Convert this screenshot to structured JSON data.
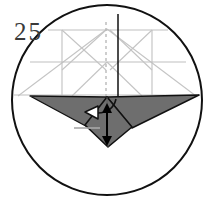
{
  "figure": {
    "kind": "origami-folding-step-diagram",
    "step_number": "25",
    "caption_position": "top-left",
    "colors": {
      "outline": "#111111",
      "paper_shaded": "#6e6e6e",
      "paper_shaded_dark": "#5f5f5f",
      "crease_line": "#b9b9b9",
      "crease_line_light": "#c9c9c9",
      "reference_line": "#a8a8a8",
      "background": "#ffffff",
      "arrow_fill_hollow": "#ffffff",
      "arrow_fill_solid": "#000000",
      "number_color": "#3a3a3a"
    },
    "frame": {
      "name": "circle-frame",
      "shape": "circle",
      "cx": 107,
      "cy": 100,
      "r": 96,
      "stroke_width": 2.0
    },
    "crease_pattern": {
      "name": "upper-crease-pattern",
      "description": "light gray construction creases in upper half of circle",
      "horizontal_lines": [
        {
          "y": 30,
          "x1": 46,
          "x2": 170
        },
        {
          "y": 62,
          "x1": 30,
          "x2": 186
        },
        {
          "y": 94,
          "x1": 16,
          "x2": 198
        }
      ],
      "vertical_lines": [
        {
          "x": 62,
          "y1": 30,
          "y2": 94
        },
        {
          "x": 152,
          "y1": 30,
          "y2": 94
        }
      ],
      "x_creases": [
        {
          "panel": "left",
          "x1": 62,
          "y1": 30,
          "x2": 107,
          "y2": 72
        },
        {
          "panel": "left",
          "x1": 107,
          "y1": 30,
          "x2": 62,
          "y2": 72
        },
        {
          "panel": "right",
          "x1": 107,
          "y1": 30,
          "x2": 152,
          "y2": 72
        },
        {
          "panel": "right",
          "x1": 152,
          "y1": 30,
          "x2": 107,
          "y2": 72
        }
      ],
      "long_diagonals": [
        {
          "x1": 107,
          "y1": 30,
          "x2": 22,
          "y2": 94
        },
        {
          "x1": 107,
          "y1": 30,
          "x2": 192,
          "y2": 94
        },
        {
          "x1": 107,
          "y1": 62,
          "x2": 74,
          "y2": 94
        },
        {
          "x1": 107,
          "y1": 62,
          "x2": 140,
          "y2": 94
        }
      ]
    },
    "center_axis": {
      "name": "center-vertical-fold-line",
      "x": 118,
      "y1": 15,
      "y2": 98,
      "stroke": "#111111",
      "style": "solid"
    },
    "dashed_axis": {
      "name": "dashed-center-crease",
      "x": 106,
      "y1": 22,
      "y2": 98,
      "stroke": "#b9b9b9",
      "style": "dashed",
      "dash_pattern": "3 3"
    },
    "folded_body": {
      "name": "shaded-folded-paper",
      "description": "wide dark gray band spanning the circle horizontally, tapering to points at each side",
      "left_wing": "M 30,97 L 107,97 L 96,131 Z",
      "right_wing": "M 107,97 L 197,96 L 131,129 Z",
      "center_kite": "M 107,97 L 131,127 L 107,146 L 86,126 Z",
      "fill": "#6e6e6e",
      "stroke": "#111111"
    },
    "reference_tick": {
      "name": "horizontal-reference-tick",
      "x1": 75,
      "y1": 128,
      "x2": 100,
      "y2": 128,
      "stroke": "#a8a8a8"
    },
    "arrows": [
      {
        "name": "fold-left-arrow",
        "type": "curved-hollow-arrow",
        "direction": "left",
        "head_fill": "#ffffff",
        "head_stroke": "#111111",
        "tail_path": "M 113,100 C 110,108 104,112 96,112",
        "head_points": "86,112 97,106 97,118",
        "stroke_width": 1.6
      },
      {
        "name": "vertical-double-arrow",
        "type": "double-headed-straight-arrow",
        "direction": "up-down",
        "fill": "#000000",
        "x": 107,
        "y_top": 106,
        "y_bottom": 142,
        "stroke_width": 1.8
      }
    ]
  }
}
